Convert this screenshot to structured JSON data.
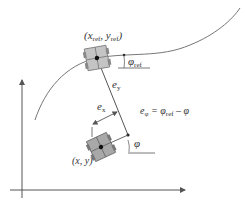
{
  "diagram": {
    "type": "vehicle path-tracking error model",
    "labels": {
      "ref_point": {
        "prefix": "(",
        "x": "x",
        "x_sub": "ref",
        "sep": ", ",
        "y": "y",
        "y_sub": "ref",
        "suffix": ")"
      },
      "phi_ref": {
        "sym": "φ",
        "sub": "ref"
      },
      "e_y": {
        "sym": "e",
        "sub": "y"
      },
      "e_x": {
        "sym": "e",
        "sub": "x"
      },
      "e_phi_eq": {
        "lhs": "e",
        "lhs_sub": "φ",
        "eq": " = ",
        "a": "φ",
        "a_sub": "ref",
        "op": " – ",
        "b": "φ"
      },
      "phi": {
        "sym": "φ"
      },
      "current_point": {
        "text": "(x, y)"
      }
    },
    "colors": {
      "line": "#555555",
      "vehicle_fill": "#bdbdbd",
      "vehicle_current_fill": "#9e9e9e",
      "vehicle_stroke": "#666666",
      "text": "#333333"
    }
  }
}
